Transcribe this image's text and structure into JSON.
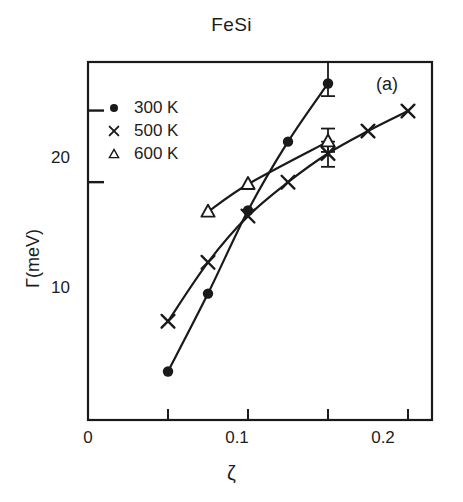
{
  "figure": {
    "title": "FeSi",
    "panel_label": "(a)",
    "xlabel": "ζ",
    "ylabel": "Γ(meV)"
  },
  "axes": {
    "x_tick_labels": [
      "0",
      "0.1",
      "0.2"
    ],
    "y_tick_labels": [
      "20",
      "10"
    ]
  },
  "legend": {
    "items": [
      {
        "label": "300 K",
        "marker": "filled-circle",
        "color": "#1a1a1a"
      },
      {
        "label": "500 K",
        "marker": "cross-x",
        "color": "#1a1a1a"
      },
      {
        "label": "600 K",
        "marker": "open-triangle",
        "color": "#1a1a1a"
      }
    ]
  },
  "chart_data": {
    "type": "scatter",
    "title": "FeSi",
    "xlabel": "ζ",
    "ylabel": "Γ(meV)",
    "xlim": [
      0,
      0.215
    ],
    "ylim": [
      1.0,
      32
    ],
    "yscale": "log",
    "xscale": "linear",
    "grid": false,
    "legend_position": "upper-left",
    "annotations": [
      "(a)"
    ],
    "x_ticks": [
      0,
      0.05,
      0.1,
      0.15,
      0.2
    ],
    "x_tick_labels": [
      "0",
      "",
      "0.1",
      "",
      "0.2"
    ],
    "y_ticks": [
      10,
      20
    ],
    "y_tick_labels": [
      "10",
      "20"
    ],
    "series": [
      {
        "name": "300 K",
        "marker": "filled-circle",
        "color": "#1a1a1a",
        "x": [
          0.05,
          0.075,
          0.1,
          0.125,
          0.15
        ],
        "y": [
          1.6,
          3.4,
          7.6,
          14.8,
          26.0
        ],
        "errors": [
          {
            "x": 0.15,
            "y": 26.0,
            "yerr_low": 3.0,
            "yerr_high": 6.0
          }
        ]
      },
      {
        "name": "500 K",
        "marker": "cross-x",
        "color": "#1a1a1a",
        "x": [
          0.05,
          0.075,
          0.1,
          0.125,
          0.15,
          0.175,
          0.2
        ],
        "y": [
          2.6,
          4.6,
          7.2,
          10.0,
          13.2,
          16.4,
          19.9
        ],
        "errors": [
          {
            "x": 0.15,
            "y": 13.2,
            "yerr_low": 1.6,
            "yerr_high": 1.6
          }
        ]
      },
      {
        "name": "600 K",
        "marker": "open-triangle",
        "color": "#1a1a1a",
        "x": [
          0.075,
          0.1,
          0.15
        ],
        "y": [
          7.5,
          9.8,
          14.8
        ],
        "errors": [
          {
            "x": 0.15,
            "y": 14.8,
            "yerr_low": 1.4,
            "yerr_high": 2.0
          }
        ]
      }
    ]
  }
}
